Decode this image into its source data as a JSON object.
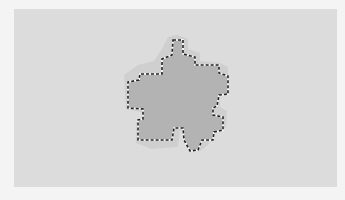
{
  "canvas": {
    "background_color": "#dcdcdc",
    "page_color": "#f4f4f4",
    "width": 323,
    "height": 178
  },
  "shape": {
    "type": "pixelated-star",
    "fill_color": "#b3b3b3",
    "halo_color": "#cfcfcf",
    "outline": "marching-ants-selection",
    "outline_dash_color": "#222222",
    "outline_gap_color": "#ffffff"
  }
}
